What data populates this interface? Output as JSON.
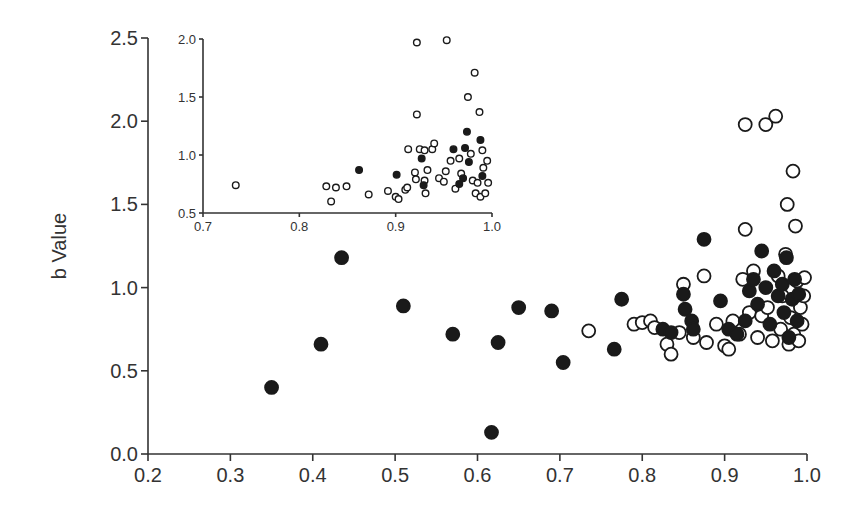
{
  "chart_data": [
    {
      "id": "main",
      "type": "scatter",
      "title": "",
      "xlabel": "",
      "ylabel": "b Value",
      "xlim": [
        0.2,
        1.0
      ],
      "ylim": [
        0.0,
        2.5
      ],
      "x_ticks": [
        "0.2",
        "0.3",
        "0.4",
        "0.5",
        "0.6",
        "0.7",
        "0.8",
        "0.9",
        "1.0"
      ],
      "y_ticks": [
        "0.0",
        "0.5",
        "1.0",
        "1.5",
        "2.0",
        "2.5"
      ],
      "grid": false,
      "legend": null,
      "series": [
        {
          "name": "filled",
          "marker": "filled-circle",
          "points": [
            [
              0.35,
              0.4
            ],
            [
              0.41,
              0.66
            ],
            [
              0.435,
              1.18
            ],
            [
              0.51,
              0.89
            ],
            [
              0.57,
              0.72
            ],
            [
              0.617,
              0.13
            ],
            [
              0.625,
              0.67
            ],
            [
              0.65,
              0.88
            ],
            [
              0.69,
              0.86
            ],
            [
              0.704,
              0.55
            ],
            [
              0.766,
              0.63
            ],
            [
              0.775,
              0.93
            ],
            [
              0.825,
              0.75
            ],
            [
              0.835,
              0.73
            ],
            [
              0.85,
              0.96
            ],
            [
              0.852,
              0.87
            ],
            [
              0.86,
              0.8
            ],
            [
              0.862,
              0.75
            ],
            [
              0.875,
              1.29
            ],
            [
              0.895,
              0.92
            ],
            [
              0.905,
              0.75
            ],
            [
              0.915,
              0.72
            ],
            [
              0.925,
              0.8
            ],
            [
              0.93,
              0.98
            ],
            [
              0.935,
              1.05
            ],
            [
              0.94,
              0.9
            ],
            [
              0.945,
              1.22
            ],
            [
              0.95,
              1.0
            ],
            [
              0.955,
              0.78
            ],
            [
              0.96,
              1.1
            ],
            [
              0.965,
              0.95
            ],
            [
              0.97,
              1.02
            ],
            [
              0.972,
              0.85
            ],
            [
              0.975,
              1.18
            ],
            [
              0.978,
              0.7
            ],
            [
              0.982,
              0.93
            ],
            [
              0.985,
              1.05
            ],
            [
              0.988,
              0.8
            ],
            [
              0.99,
              0.96
            ]
          ]
        },
        {
          "name": "open",
          "marker": "open-circle",
          "points": [
            [
              0.735,
              0.74
            ],
            [
              0.79,
              0.78
            ],
            [
              0.8,
              0.79
            ],
            [
              0.81,
              0.8
            ],
            [
              0.815,
              0.76
            ],
            [
              0.83,
              0.66
            ],
            [
              0.835,
              0.6
            ],
            [
              0.845,
              0.73
            ],
            [
              0.85,
              1.02
            ],
            [
              0.862,
              0.7
            ],
            [
              0.875,
              1.07
            ],
            [
              0.878,
              0.67
            ],
            [
              0.89,
              0.78
            ],
            [
              0.9,
              0.65
            ],
            [
              0.905,
              0.63
            ],
            [
              0.91,
              0.8
            ],
            [
              0.918,
              0.72
            ],
            [
              0.922,
              1.05
            ],
            [
              0.925,
              1.35
            ],
            [
              0.925,
              1.98
            ],
            [
              0.93,
              0.85
            ],
            [
              0.935,
              1.1
            ],
            [
              0.94,
              0.7
            ],
            [
              0.945,
              0.83
            ],
            [
              0.95,
              1.98
            ],
            [
              0.952,
              0.88
            ],
            [
              0.958,
              0.68
            ],
            [
              0.962,
              2.03
            ],
            [
              0.965,
              1.07
            ],
            [
              0.968,
              0.75
            ],
            [
              0.97,
              0.95
            ],
            [
              0.974,
              1.2
            ],
            [
              0.976,
              1.5
            ],
            [
              0.978,
              0.66
            ],
            [
              0.98,
              0.82
            ],
            [
              0.983,
              1.7
            ],
            [
              0.984,
              0.72
            ],
            [
              0.986,
              1.37
            ],
            [
              0.988,
              1.04
            ],
            [
              0.99,
              0.68
            ],
            [
              0.992,
              0.88
            ],
            [
              0.994,
              0.78
            ],
            [
              0.996,
              0.95
            ],
            [
              0.997,
              1.06
            ]
          ]
        }
      ]
    },
    {
      "id": "inset",
      "type": "scatter",
      "title": "",
      "xlabel": "",
      "ylabel": "",
      "xlim": [
        0.7,
        1.0
      ],
      "ylim": [
        0.5,
        2.0
      ],
      "x_ticks": [
        "0.7",
        "0.8",
        "0.9",
        "1.0"
      ],
      "y_ticks": [
        "0.5",
        "1.0",
        "1.5",
        "2.0"
      ],
      "grid": false,
      "legend": null,
      "series": [
        {
          "name": "filled",
          "marker": "filled-circle",
          "points": [
            [
              0.862,
              0.87
            ],
            [
              0.901,
              0.83
            ],
            [
              0.927,
              0.97
            ],
            [
              0.929,
              0.74
            ],
            [
              0.96,
              1.05
            ],
            [
              0.966,
              0.75
            ],
            [
              0.972,
              1.06
            ],
            [
              0.974,
              1.2
            ],
            [
              0.976,
              0.94
            ],
            [
              0.988,
              1.13
            ],
            [
              0.99,
              0.82
            ],
            [
              0.97,
              0.8
            ]
          ]
        },
        {
          "name": "open",
          "marker": "open-circle",
          "points": [
            [
              0.734,
              0.74
            ],
            [
              0.828,
              0.73
            ],
            [
              0.833,
              0.6
            ],
            [
              0.838,
              0.72
            ],
            [
              0.849,
              0.73
            ],
            [
              0.872,
              0.66
            ],
            [
              0.892,
              0.69
            ],
            [
              0.9,
              0.64
            ],
            [
              0.903,
              0.62
            ],
            [
              0.91,
              0.7
            ],
            [
              0.912,
              0.72
            ],
            [
              0.913,
              1.05
            ],
            [
              0.92,
              0.85
            ],
            [
              0.921,
              0.79
            ],
            [
              0.922,
              1.97
            ],
            [
              0.922,
              1.35
            ],
            [
              0.925,
              1.05
            ],
            [
              0.93,
              1.04
            ],
            [
              0.93,
              0.78
            ],
            [
              0.931,
              0.67
            ],
            [
              0.933,
              0.87
            ],
            [
              0.938,
              1.05
            ],
            [
              0.94,
              1.1
            ],
            [
              0.945,
              0.8
            ],
            [
              0.95,
              0.77
            ],
            [
              0.952,
              0.86
            ],
            [
              0.953,
              1.99
            ],
            [
              0.957,
              0.95
            ],
            [
              0.962,
              0.71
            ],
            [
              0.966,
              0.97
            ],
            [
              0.968,
              0.84
            ],
            [
              0.975,
              1.5
            ],
            [
              0.978,
              1.01
            ],
            [
              0.98,
              0.78
            ],
            [
              0.982,
              1.71
            ],
            [
              0.983,
              0.67
            ],
            [
              0.985,
              0.76
            ],
            [
              0.987,
              1.37
            ],
            [
              0.988,
              0.64
            ],
            [
              0.99,
              1.04
            ],
            [
              0.991,
              0.89
            ],
            [
              0.993,
              0.67
            ],
            [
              0.995,
              0.95
            ],
            [
              0.996,
              0.76
            ]
          ]
        }
      ]
    }
  ],
  "layout": {
    "main": {
      "px_x0": 148,
      "px_x1": 807,
      "px_y0": 454,
      "px_y1": 38
    },
    "inset": {
      "px_x0": 203,
      "px_x1": 492,
      "px_y0": 213,
      "px_y1": 39
    },
    "colors": {
      "axis": "#333333",
      "marker": "#1a1a1a",
      "background": "#ffffff"
    }
  }
}
